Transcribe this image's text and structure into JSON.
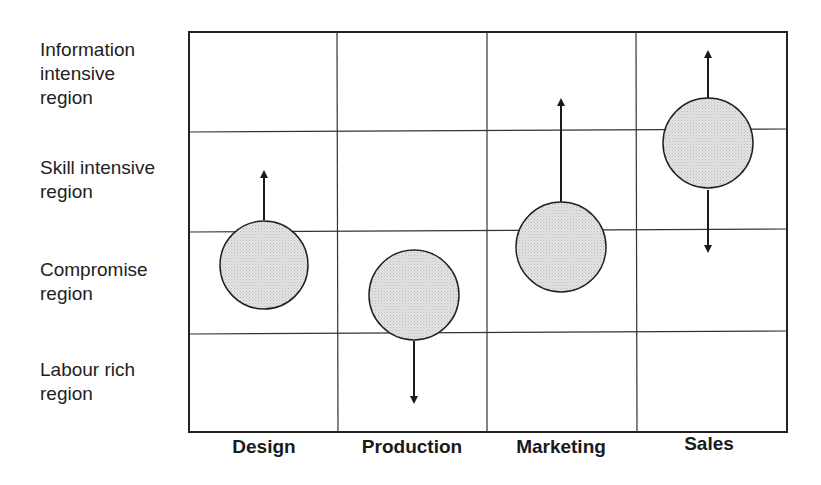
{
  "diagram": {
    "rows": [
      {
        "label_line1": "Information",
        "label_line2": "intensive",
        "label_line3": "region"
      },
      {
        "label_line1": "Skill intensive",
        "label_line2": "region"
      },
      {
        "label_line1": "Compromise",
        "label_line2": "region"
      },
      {
        "label_line1": "Labour rich",
        "label_line2": "region"
      }
    ],
    "columns": [
      {
        "label": "Design"
      },
      {
        "label": "Production"
      },
      {
        "label": "Marketing"
      },
      {
        "label": "Sales"
      }
    ],
    "nodes": [
      {
        "column": "Design",
        "position": "straddling Skill intensive / Compromise boundary",
        "arrows": [
          "up"
        ]
      },
      {
        "column": "Production",
        "position": "straddling Compromise / Labour rich boundary",
        "arrows": [
          "down"
        ]
      },
      {
        "column": "Marketing",
        "position": "straddling Skill intensive / Compromise boundary",
        "arrows": [
          "up"
        ]
      },
      {
        "column": "Sales",
        "position": "straddling Information intensive / Skill intensive boundary",
        "arrows": [
          "up",
          "down"
        ]
      }
    ],
    "colors": {
      "line": "#222222",
      "circle_fill": "#d9d9d9",
      "background": "#ffffff"
    }
  }
}
